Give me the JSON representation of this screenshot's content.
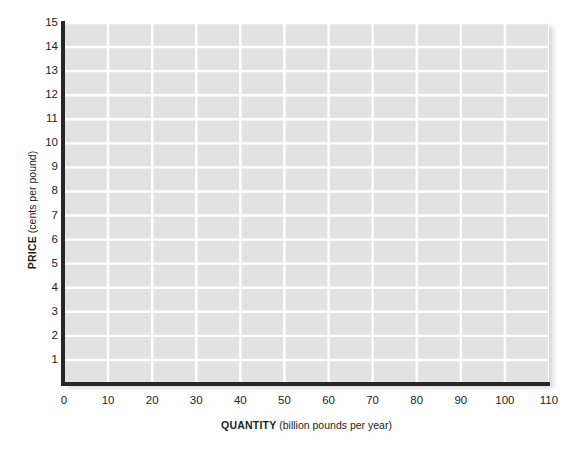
{
  "chart_data": {
    "type": "line",
    "title": "",
    "subtitle": "",
    "xlabel_bold": "QUANTITY",
    "xlabel_unit": "(billion pounds per year)",
    "ylabel_bold": "PRICE",
    "ylabel_unit": "(cents per pound)",
    "xlim": [
      0,
      110
    ],
    "ylim": [
      0,
      15
    ],
    "xticks": [
      0,
      10,
      20,
      30,
      40,
      50,
      60,
      70,
      80,
      90,
      100,
      110
    ],
    "xtick_labels": [
      "0",
      "10",
      "20",
      "30",
      "40",
      "50",
      "60",
      "70",
      "80",
      "90",
      "100",
      "110"
    ],
    "yticks": [
      1,
      2,
      3,
      4,
      5,
      6,
      7,
      8,
      9,
      10,
      11,
      12,
      13,
      14,
      15
    ],
    "ytick_labels": [
      "1",
      "2",
      "3",
      "4",
      "5",
      "6",
      "7",
      "8",
      "9",
      "10",
      "11",
      "12",
      "13",
      "14",
      "15"
    ],
    "grid": true,
    "grid_x_step": 10,
    "grid_y_step": 1,
    "legend": false,
    "legend_entries": [],
    "series": [],
    "annotations": [],
    "colors": {
      "plot_background": "#e2e2e2",
      "gridline": "#ffffff",
      "axis_line": "#272727",
      "tick_label": "#231f20",
      "figure_background": "#fefefe"
    }
  }
}
